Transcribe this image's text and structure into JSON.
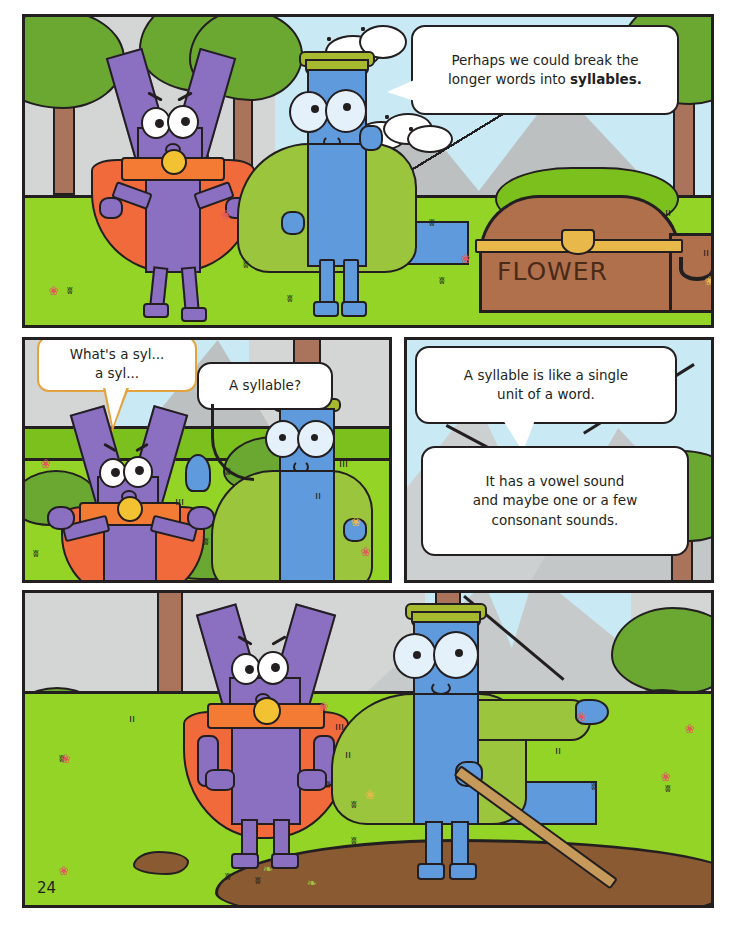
{
  "page": {
    "number": "24",
    "width": 735,
    "height": 928,
    "background": "#ffffff"
  },
  "colors": {
    "panel_border": "#231f20",
    "grass_green": "#93d427",
    "grass_dark": "#7cc01e",
    "sky_blue": "#c9e9f4",
    "mountain_grey": "#bdc0c1",
    "haze_grey": "#d4d6d6",
    "tree_green": "#6aa832",
    "trunk_brown": "#a9745b",
    "v_purple": "#8b6fc0",
    "cape_orange": "#f06a3c",
    "sash_orange": "#f47b33",
    "knot_yellow": "#f2c233",
    "l_blue": "#5f9bdc",
    "cloak_green": "#9bc53d",
    "hat_olive": "#a7b92e",
    "chest_brown": "#b0704c",
    "chest_gold": "#e8b94a",
    "mud_brown": "#8a5a33",
    "bubble_white": "#ffffff",
    "bubble_tan_border": "#e3a33f"
  },
  "panels": [
    {
      "id": "panel-top",
      "name": "panel-1-forest-with-chest",
      "bubbles": [
        {
          "id": "bubble-perhaps",
          "speaker": "l-character",
          "border": "black",
          "lines": [
            "Perhaps we could break the",
            "longer words into "
          ],
          "bold_word": "syllables.",
          "text": "Perhaps we could break the longer words into syllables."
        }
      ],
      "props": [
        {
          "name": "treasure-chest",
          "label": "FLOWER"
        }
      ]
    },
    {
      "id": "panel-mid-left",
      "name": "panel-2-confused-v",
      "bubbles": [
        {
          "id": "bubble-whats-a-syl",
          "speaker": "v-character",
          "border": "tan",
          "lines": [
            "What's a syl...",
            "a syl..."
          ],
          "text": "What's a syl... a syl..."
        },
        {
          "id": "bubble-a-syllable",
          "speaker": "l-character",
          "border": "black",
          "lines": [
            "A syllable?"
          ],
          "text": "A syllable?"
        }
      ]
    },
    {
      "id": "panel-mid-right",
      "name": "panel-3-explanation",
      "bubbles": [
        {
          "id": "bubble-definition",
          "speaker": "l-character",
          "border": "black",
          "lines": [
            "A syllable is like a single",
            "unit of a word."
          ],
          "text": "A syllable is like a single unit of a word."
        },
        {
          "id": "bubble-vowel-sound",
          "speaker": "l-character",
          "border": "black",
          "lines": [
            "It has a vowel sound",
            "and maybe one or a few",
            "consonant sounds."
          ],
          "text": "It has a vowel sound and maybe one or a few consonant sounds."
        }
      ]
    },
    {
      "id": "panel-bottom",
      "name": "panel-4-by-the-mud",
      "bubbles": [],
      "props": [
        {
          "name": "mud-puddle",
          "label": ""
        },
        {
          "name": "pointing-stick",
          "label": ""
        }
      ]
    }
  ],
  "characters": [
    {
      "id": "v-character",
      "name": "purple-letter-v-superhero",
      "letter": "V",
      "body_color": "#8b6fc0",
      "cape_color": "#f06a3c"
    },
    {
      "id": "l-character",
      "name": "blue-letter-l-wizard",
      "letter": "L",
      "body_color": "#5f9bdc",
      "cloak_color": "#9bc53d"
    }
  ]
}
